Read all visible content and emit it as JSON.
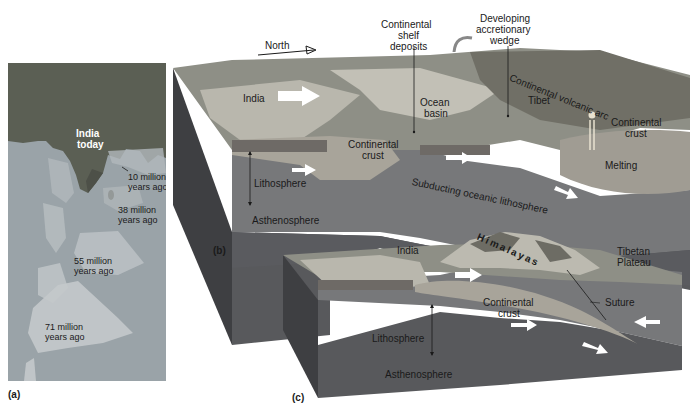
{
  "panel_a": {
    "tag": "(a)",
    "india_today": [
      "India",
      "today"
    ],
    "positions": [
      {
        "line1": "10 million",
        "line2": "years ago"
      },
      {
        "line1": "38 million",
        "line2": "years ago"
      },
      {
        "line1": "55 million",
        "line2": "years ago"
      },
      {
        "line1": "71 million",
        "line2": "years ago"
      }
    ]
  },
  "panel_b": {
    "tag": "(b)",
    "north": "North",
    "india": "India",
    "continental_shelf_deposits": [
      "Continental",
      "shelf",
      "deposits"
    ],
    "developing_accretionary_wedge": [
      "Developing",
      "accretionary",
      "wedge"
    ],
    "continental_volcanic_arc": "Continental volcanic arc",
    "tibet": "Tibet",
    "ocean_basin": [
      "Ocean",
      "basin"
    ],
    "continental_crust_left": [
      "Continental",
      "crust"
    ],
    "continental_crust_right": [
      "Continental",
      "crust"
    ],
    "lithosphere": "Lithosphere",
    "asthenosphere": "Asthenosphere",
    "subducting": "Subducting oceanic lithosphere",
    "melting": "Melting"
  },
  "panel_c": {
    "tag": "(c)",
    "india": "India",
    "himalayas": "Himalayas",
    "tibetan_plateau": [
      "Tibetan",
      "Plateau"
    ],
    "continental_crust": [
      "Continental",
      "crust"
    ],
    "suture": "Suture",
    "lithosphere": "Lithosphere",
    "asthenosphere": "Asthenosphere"
  },
  "colors": {
    "ocean_map": "#9aa3a8",
    "land_map": "#5b5f54",
    "surface": "#8e8f86",
    "shelf": "#b9b7ad",
    "crust": "#a8a49a",
    "lithosphere": "#77787a",
    "asthenosphere": "#58595c",
    "side_dark": "#3e3f42",
    "arrow": "#ffffff"
  }
}
